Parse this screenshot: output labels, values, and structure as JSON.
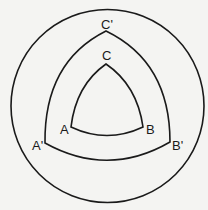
{
  "diagram": {
    "outer_circle": true,
    "triangles": [
      {
        "name": "inner",
        "vertices": [
          "A",
          "B",
          "C"
        ]
      },
      {
        "name": "outer",
        "vertices": [
          "A'",
          "B'",
          "C'"
        ]
      }
    ],
    "labels": {
      "A": "A",
      "B": "B",
      "C": "C",
      "A_prime": "A'",
      "B_prime": "B'",
      "C_prime": "C'"
    },
    "colors": {
      "ink": "#1a1a1a",
      "paper": "#f4f4f2"
    }
  }
}
